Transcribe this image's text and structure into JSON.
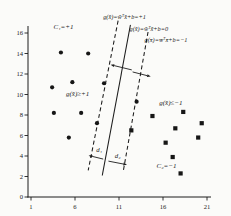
{
  "figure": {
    "background": "#fbfbf9",
    "ink": "#1c1c1c"
  },
  "chart_data": {
    "type": "scatter",
    "title": "",
    "xlabel": "",
    "ylabel": "",
    "xlim": [
      1,
      21
    ],
    "ylim": [
      0,
      16
    ],
    "xticks": [
      1,
      6,
      11,
      16,
      21
    ],
    "yticks": [
      0,
      2,
      4,
      6,
      8,
      10,
      12,
      14,
      16
    ],
    "grid": false,
    "series": [
      {
        "name": "class-C1-plus-one",
        "marker": "circle",
        "color": "#161616",
        "points": [
          [
            4.4,
            14.1
          ],
          [
            7.5,
            14.0
          ],
          [
            3.4,
            10.7
          ],
          [
            5.7,
            11.2
          ],
          [
            9.3,
            11.1
          ],
          [
            3.6,
            8.2
          ],
          [
            6.7,
            8.2
          ],
          [
            8.5,
            7.2
          ],
          [
            5.3,
            5.8
          ],
          [
            13.0,
            9.3
          ]
        ]
      },
      {
        "name": "class-C2-minus-one",
        "marker": "square",
        "color": "#161616",
        "points": [
          [
            14.8,
            7.9
          ],
          [
            18.3,
            8.3
          ],
          [
            20.4,
            7.2
          ],
          [
            17.4,
            6.7
          ],
          [
            20.0,
            5.8
          ],
          [
            16.3,
            5.3
          ],
          [
            12.4,
            6.5
          ],
          [
            17.1,
            3.9
          ],
          [
            18.0,
            2.3
          ]
        ]
      }
    ],
    "lines": [
      {
        "name": "margin-line-plus-one",
        "style": "dashed",
        "from": [
          10.9,
          17.2
        ],
        "to": [
          7.5,
          2.6
        ]
      },
      {
        "name": "decision-boundary",
        "style": "solid",
        "from": [
          12.3,
          16.8
        ],
        "to": [
          9.1,
          2.1
        ]
      },
      {
        "name": "margin-line-minus-one",
        "style": "dashed",
        "from": [
          14.3,
          16.1
        ],
        "to": [
          11.5,
          2.6
        ]
      }
    ],
    "arrows": [
      {
        "name": "margin-width-left-arrow",
        "from": [
          12.45,
          12.4
        ],
        "to": [
          10.05,
          12.9
        ]
      },
      {
        "name": "margin-width-right-arrow",
        "from": [
          12.55,
          12.2
        ],
        "to": [
          14.6,
          11.75
        ]
      },
      {
        "name": "d1-arrow",
        "from": [
          9.2,
          3.7
        ],
        "to": [
          7.55,
          4.05
        ]
      },
      {
        "name": "d2-arrow",
        "from": [
          9.8,
          3.5
        ],
        "to": [
          11.9,
          3.15
        ]
      }
    ],
    "annotations": [
      {
        "name": "class1-label",
        "text": "C₁=+1",
        "x": 4.7,
        "y": 16.4,
        "anchor": "middle",
        "size": 7
      },
      {
        "name": "equation-plus-one",
        "text": "g(x̄)=w̄ᵀx̄+b=+1",
        "x": 9.2,
        "y": 17.4,
        "anchor": "start",
        "size": 6.3
      },
      {
        "name": "equation-zero",
        "text": "g(x̄)=w̄ᵀx̄+b=0",
        "x": 12.2,
        "y": 16.2,
        "anchor": "start",
        "size": 6.3
      },
      {
        "name": "equation-minus-one",
        "text": "g(x̄)=w̄ᵀx̄+b=−1",
        "x": 13.9,
        "y": 15.1,
        "anchor": "start",
        "size": 6.3
      },
      {
        "name": "region-plus-label",
        "text": "g(x̄)≥+1",
        "x": 6.3,
        "y": 9.9,
        "anchor": "middle",
        "size": 7
      },
      {
        "name": "region-minus-label",
        "text": "g(x̄)≤−1",
        "x": 16.9,
        "y": 9.0,
        "anchor": "middle",
        "size": 7
      },
      {
        "name": "class2-label",
        "text": "C₂=−1",
        "x": 16.4,
        "y": 2.8,
        "anchor": "middle",
        "size": 7
      },
      {
        "name": "d1-label",
        "text": "d₁",
        "x": 8.75,
        "y": 4.35,
        "anchor": "middle",
        "size": 6.8
      },
      {
        "name": "d2-label",
        "text": "d₂",
        "x": 10.85,
        "y": 3.85,
        "anchor": "middle",
        "size": 6.8
      }
    ]
  }
}
